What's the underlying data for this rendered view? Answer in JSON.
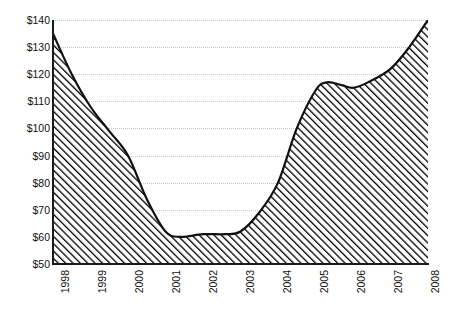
{
  "chart_data": {
    "type": "area",
    "title": "",
    "subtitle": "",
    "xlabel": "",
    "ylabel": "",
    "categories": [
      "1998",
      "1999",
      "2000",
      "2001",
      "2002",
      "2003",
      "2004",
      "2005",
      "2006",
      "2007",
      "2008"
    ],
    "values": [
      135,
      108,
      90,
      62,
      61,
      62,
      80,
      116,
      115,
      122,
      140
    ],
    "series": [
      {
        "name": "",
        "values": [
          135,
          108,
          90,
          62,
          61,
          62,
          80,
          116,
          115,
          122,
          140
        ]
      }
    ],
    "dense_points": [
      {
        "x": 1998.0,
        "y": 135
      },
      {
        "x": 1998.5,
        "y": 120
      },
      {
        "x": 1999.0,
        "y": 108
      },
      {
        "x": 1999.5,
        "y": 99
      },
      {
        "x": 2000.0,
        "y": 90
      },
      {
        "x": 2000.5,
        "y": 74
      },
      {
        "x": 2001.0,
        "y": 62
      },
      {
        "x": 2001.4,
        "y": 60
      },
      {
        "x": 2002.0,
        "y": 61
      },
      {
        "x": 2002.6,
        "y": 61
      },
      {
        "x": 2003.0,
        "y": 62
      },
      {
        "x": 2003.5,
        "y": 69
      },
      {
        "x": 2004.0,
        "y": 80
      },
      {
        "x": 2004.5,
        "y": 100
      },
      {
        "x": 2005.0,
        "y": 114
      },
      {
        "x": 2005.3,
        "y": 117
      },
      {
        "x": 2005.7,
        "y": 116
      },
      {
        "x": 2006.0,
        "y": 115
      },
      {
        "x": 2006.4,
        "y": 117
      },
      {
        "x": 2007.0,
        "y": 122
      },
      {
        "x": 2007.5,
        "y": 130
      },
      {
        "x": 2008.0,
        "y": 140
      }
    ],
    "ylim": [
      50,
      140
    ],
    "xlim": [
      "1998",
      "2008"
    ],
    "ytick_labels": [
      "$140",
      "$130",
      "$120",
      "$110",
      "$100",
      "$90",
      "$80",
      "$70",
      "$60",
      "$50"
    ],
    "ytick_values": [
      140,
      130,
      120,
      110,
      100,
      90,
      80,
      70,
      60,
      50
    ],
    "xtick_labels": [
      "1998",
      "1999",
      "2000",
      "2001",
      "2002",
      "2003",
      "2004",
      "2005",
      "2006",
      "2007",
      "2008"
    ],
    "grid": true,
    "grid_style": "dotted-horizontal",
    "legend": false,
    "legend_position": "none",
    "annotations": [],
    "colors": {
      "line": "#111111",
      "fill_pattern": "diagonal-hatch",
      "hatch_color": "#000000",
      "background": "#ffffff",
      "gridline": "#c9c9c9",
      "axis": "#1a1a1a",
      "text": "#111111"
    }
  }
}
